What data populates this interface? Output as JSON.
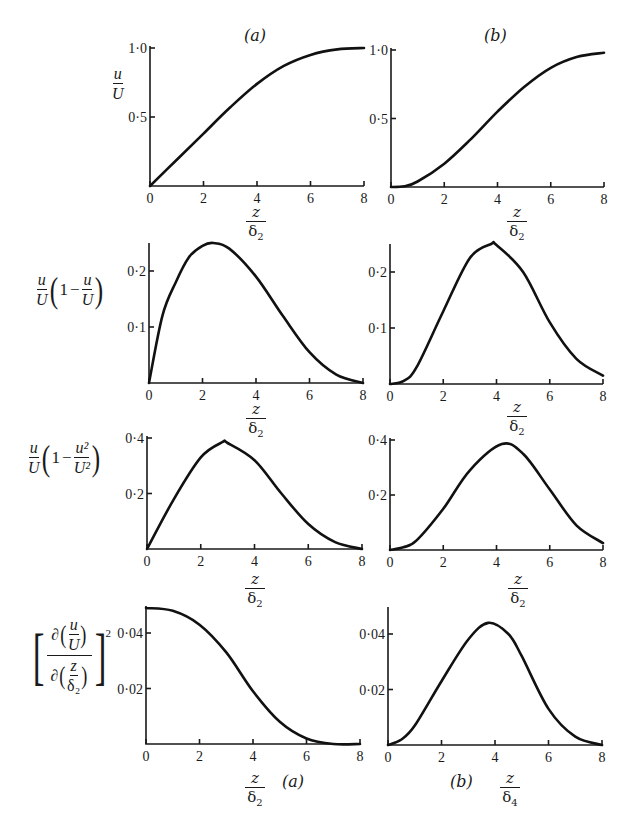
{
  "figure": {
    "panel_labels": {
      "a": "(a)",
      "b": "(b)"
    },
    "x_axis_label": {
      "num": "z",
      "den": "δ",
      "den_sub": "2",
      "den_sub_b4": "4"
    },
    "y_labels": {
      "row1": {
        "num": "u",
        "den": "U"
      },
      "row2": {
        "text": "u/U (1 − u/U)",
        "num": "u",
        "den": "U",
        "one": "1",
        "minus": "−"
      },
      "row3": {
        "text": "u/U (1 − u²/U²)",
        "num": "u",
        "den": "U",
        "one": "1",
        "minus": "−",
        "num2": "u²",
        "den2": "U²"
      },
      "row4": {
        "text": "[∂(u/U) / ∂(z/δ₂)]²",
        "partial": "∂",
        "num": "u",
        "den": "U",
        "znum": "z",
        "zden": "δ₂",
        "exp": "2"
      }
    }
  },
  "chart_data": [
    {
      "type": "line",
      "id": "a1",
      "title": "(a)",
      "xlabel": "z/δ₂",
      "ylabel": "u/U",
      "xlim": [
        0,
        8
      ],
      "ylim": [
        0,
        1.0
      ],
      "xticks": [
        "0",
        "2",
        "4",
        "6",
        "8"
      ],
      "yticks": [
        {
          "v": 0.5,
          "label": "0·5"
        },
        {
          "v": 1.0,
          "label": "1·0"
        }
      ],
      "x": [
        0,
        1,
        2,
        3,
        4,
        5,
        6,
        7,
        8
      ],
      "y": [
        0,
        0.19,
        0.38,
        0.57,
        0.74,
        0.87,
        0.95,
        0.99,
        1.0
      ]
    },
    {
      "type": "line",
      "id": "b1",
      "title": "(b)",
      "xlabel": "z/δ₂",
      "ylabel": "u/U",
      "xlim": [
        0,
        8
      ],
      "ylim": [
        0,
        1.0
      ],
      "xticks": [
        "0",
        "2",
        "4",
        "6",
        "8"
      ],
      "yticks": [
        {
          "v": 0.5,
          "label": "0·5"
        },
        {
          "v": 1.0,
          "label": "1·0"
        }
      ],
      "x": [
        0,
        0.5,
        1,
        2,
        3,
        4,
        5,
        6,
        7,
        8
      ],
      "y": [
        0,
        0.005,
        0.04,
        0.17,
        0.35,
        0.55,
        0.73,
        0.87,
        0.95,
        0.98
      ]
    },
    {
      "type": "line",
      "id": "a2",
      "xlabel": "z/δ₂",
      "ylabel": "u/U (1 − u/U)",
      "xlim": [
        0,
        8
      ],
      "ylim": [
        0,
        0.26
      ],
      "xticks": [
        "0",
        "2",
        "4",
        "6",
        "8"
      ],
      "yticks": [
        {
          "v": 0.1,
          "label": "0·1"
        },
        {
          "v": 0.2,
          "label": "0·2"
        }
      ],
      "x": [
        0,
        0.5,
        1,
        1.5,
        2,
        2.4,
        3,
        4,
        5,
        6,
        7,
        8
      ],
      "y": [
        0,
        0.12,
        0.18,
        0.225,
        0.245,
        0.25,
        0.24,
        0.19,
        0.12,
        0.055,
        0.015,
        0
      ]
    },
    {
      "type": "line",
      "id": "b2",
      "xlabel": "z/δ₂",
      "ylabel": "u/U (1 − u/U)",
      "xlim": [
        0,
        8
      ],
      "ylim": [
        0,
        0.26
      ],
      "xticks": [
        "0",
        "2",
        "4",
        "6",
        "8"
      ],
      "yticks": [
        {
          "v": 0.1,
          "label": "0·1"
        },
        {
          "v": 0.2,
          "label": "0·2"
        }
      ],
      "x": [
        0,
        0.5,
        1,
        2,
        3,
        3.8,
        4,
        5,
        6,
        7,
        8
      ],
      "y": [
        0,
        0.005,
        0.03,
        0.13,
        0.225,
        0.25,
        0.248,
        0.2,
        0.11,
        0.045,
        0.015
      ]
    },
    {
      "type": "line",
      "id": "a3",
      "xlabel": "z/δ₂",
      "ylabel": "u/U (1 − u²/U²)",
      "xlim": [
        0,
        8
      ],
      "ylim": [
        0,
        0.4
      ],
      "xticks": [
        "0",
        "2",
        "4",
        "6",
        "8"
      ],
      "yticks": [
        {
          "v": 0.2,
          "label": "0·2"
        },
        {
          "v": 0.4,
          "label": "0·4"
        }
      ],
      "x": [
        0,
        1,
        2,
        2.8,
        3,
        4,
        5,
        6,
        7,
        8
      ],
      "y": [
        0,
        0.18,
        0.33,
        0.385,
        0.382,
        0.32,
        0.2,
        0.09,
        0.025,
        0
      ]
    },
    {
      "type": "line",
      "id": "b3",
      "xlabel": "z/δ₂",
      "ylabel": "u/U (1 − u²/U²)",
      "xlim": [
        0,
        8
      ],
      "ylim": [
        0,
        0.4
      ],
      "xticks": [
        "0",
        "2",
        "4",
        "6",
        "8"
      ],
      "yticks": [
        {
          "v": 0.2,
          "label": "0·2"
        },
        {
          "v": 0.4,
          "label": "0·4"
        }
      ],
      "x": [
        0,
        0.5,
        1,
        2,
        3,
        4.2,
        5,
        6,
        7,
        8
      ],
      "y": [
        0,
        0.01,
        0.035,
        0.15,
        0.29,
        0.385,
        0.35,
        0.22,
        0.09,
        0.025
      ]
    },
    {
      "type": "line",
      "id": "a4",
      "caption": "(a)",
      "xlabel": "z/δ₂",
      "ylabel": "[∂(u/U)/∂(z/δ₂)]²",
      "xlim": [
        0,
        8
      ],
      "ylim": [
        0,
        0.05
      ],
      "xticks": [
        "0",
        "2",
        "4",
        "6",
        "8"
      ],
      "yticks": [
        {
          "v": 0.02,
          "label": "0·02"
        },
        {
          "v": 0.04,
          "label": "0·04"
        }
      ],
      "x": [
        0,
        1,
        2,
        3,
        4,
        5,
        6,
        7,
        8
      ],
      "y": [
        0.049,
        0.048,
        0.043,
        0.033,
        0.019,
        0.008,
        0.002,
        0,
        0
      ]
    },
    {
      "type": "line",
      "id": "b4",
      "caption": "(b)",
      "xlabel": "z/δ₄",
      "ylabel": "[∂(u/U)/∂(z/δ₂)]²",
      "xlim": [
        0,
        8
      ],
      "ylim": [
        0,
        0.05
      ],
      "xticks": [
        "0",
        "2",
        "4",
        "6",
        "8"
      ],
      "yticks": [
        {
          "v": 0.02,
          "label": "0·02"
        },
        {
          "v": 0.04,
          "label": "0·04"
        }
      ],
      "x": [
        0,
        0.5,
        1,
        2,
        3,
        3.75,
        4.5,
        5,
        6,
        7,
        8
      ],
      "y": [
        0,
        0.002,
        0.007,
        0.023,
        0.038,
        0.044,
        0.04,
        0.032,
        0.013,
        0.003,
        0
      ]
    }
  ]
}
